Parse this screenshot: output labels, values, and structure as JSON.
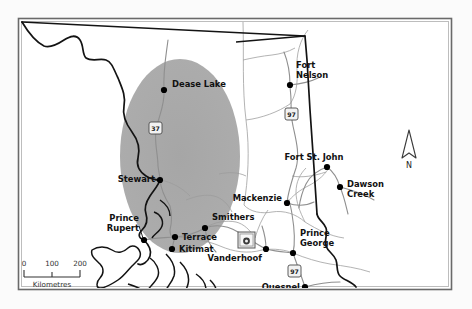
{
  "map": {
    "title": "Northern British Columbia regional map",
    "background_color": "#fbfbfb",
    "land_color": "#ffffff",
    "frame_color": "#5a5a5a",
    "study_area_color": "#a8a8a8",
    "province_border_color": "#1a1a1a",
    "subregion_border_color": "#8d8d8d",
    "road_color": "#9a9a9a",
    "dot_color": "#000000",
    "label_color": "#111111"
  },
  "cities": [
    {
      "name": "Dease Lake",
      "label_lines": [
        "Dease Lake"
      ],
      "dot_x": 164,
      "dot_y": 90,
      "label_x": 172,
      "label_y": 87,
      "anchor": "start",
      "leader": false
    },
    {
      "name": "Fort Nelson",
      "label_lines": [
        "Fort",
        "Nelson"
      ],
      "dot_x": 290,
      "dot_y": 85,
      "label_x": 296,
      "label_y": 68,
      "anchor": "start",
      "leader": false
    },
    {
      "name": "Stewart",
      "label_lines": [
        "Stewart"
      ],
      "dot_x": 160,
      "dot_y": 180,
      "label_x": 155,
      "label_y": 182,
      "anchor": "end",
      "leader": false
    },
    {
      "name": "Prince Rupert",
      "label_lines": [
        "Prince",
        "Rupert"
      ],
      "dot_x": 144,
      "dot_y": 240,
      "label_x": 139,
      "label_y": 221,
      "anchor": "end",
      "leader": true,
      "leader_x1": 139,
      "leader_y1": 228,
      "leader_x2": 143,
      "leader_y2": 239
    },
    {
      "name": "Terrace",
      "label_lines": [
        "Terrace"
      ],
      "dot_x": 175,
      "dot_y": 237,
      "label_x": 182,
      "label_y": 240,
      "anchor": "start",
      "leader": false
    },
    {
      "name": "Kitimat",
      "label_lines": [
        "Kitimat"
      ],
      "dot_x": 172,
      "dot_y": 249,
      "label_x": 179,
      "label_y": 252,
      "anchor": "start",
      "leader": false
    },
    {
      "name": "Smithers",
      "label_lines": [
        "Smithers"
      ],
      "dot_x": 205,
      "dot_y": 228,
      "label_x": 212,
      "label_y": 220,
      "anchor": "start",
      "leader": false
    },
    {
      "name": "Mackenzie",
      "label_lines": [
        "Mackenzie"
      ],
      "dot_x": 287,
      "dot_y": 203,
      "label_x": 282,
      "label_y": 201,
      "anchor": "end",
      "leader": false
    },
    {
      "name": "Vanderhoof",
      "label_lines": [
        "Vanderhoof"
      ],
      "dot_x": 266,
      "dot_y": 249,
      "label_x": 260,
      "label_y": 259,
      "anchor": "end",
      "leader": false
    },
    {
      "name": "Prince George",
      "label_lines": [
        "Prince",
        "George"
      ],
      "dot_x": 293,
      "dot_y": 253,
      "label_x": 300,
      "label_y": 236,
      "anchor": "start",
      "leader": false
    },
    {
      "name": "Fort St. John",
      "label_lines": [
        "Fort St. John"
      ],
      "dot_x": 327,
      "dot_y": 167,
      "label_x": 314,
      "label_y": 160,
      "anchor": "start",
      "leader": false
    },
    {
      "name": "Dawson Creek",
      "label_lines": [
        "Dawson",
        "Creek"
      ],
      "dot_x": 340,
      "dot_y": 187,
      "label_x": 347,
      "label_y": 187,
      "anchor": "start",
      "leader": false
    },
    {
      "name": "Quesnel",
      "label_lines": [
        "Quesnel"
      ],
      "dot_x": 305,
      "dot_y": 287,
      "label_x": 300,
      "label_y": 290,
      "anchor": "end",
      "leader": false
    }
  ],
  "highway_shields": [
    {
      "number": "37",
      "x": 155,
      "y": 128
    },
    {
      "number": "97",
      "x": 291,
      "y": 114
    },
    {
      "number": "97",
      "x": 294,
      "y": 271
    }
  ],
  "facility_marker": {
    "name": "facility-site-marker",
    "x": 246,
    "y": 240
  },
  "scale_bar": {
    "ticks": [
      "0",
      "100",
      "200"
    ],
    "caption": "Kilometres",
    "x": 22,
    "y": 268,
    "width": 60
  },
  "compass": {
    "letter": "N",
    "x": 409,
    "y": 150
  },
  "study_area": {
    "name": "shaded-study-area-ellipse",
    "cx": 180,
    "cy": 156,
    "rx": 60,
    "ry": 97
  }
}
